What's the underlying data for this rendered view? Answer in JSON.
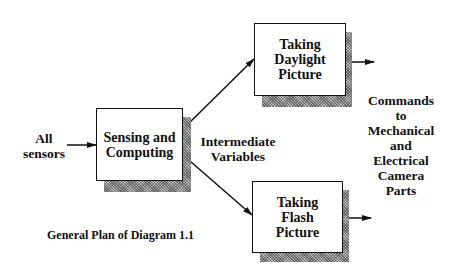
{
  "diagram": {
    "input_label": [
      "All",
      "sensors"
    ],
    "boxes": {
      "sensing": [
        "Sensing and",
        "Computing"
      ],
      "daylight": [
        "Taking",
        "Daylight",
        "Picture"
      ],
      "flash": [
        "Taking",
        "Flash",
        "Picture"
      ]
    },
    "intermediate_label": [
      "Intermediate",
      "Variables"
    ],
    "output_label": [
      "Commands",
      "to",
      "Mechanical",
      "and",
      "Electrical",
      "Camera",
      "Parts"
    ],
    "caption": "General Plan of Diagram 1.1"
  },
  "colors": {
    "line": "#111111",
    "shadow": "#bdbdbd",
    "background": "#ffffff"
  }
}
